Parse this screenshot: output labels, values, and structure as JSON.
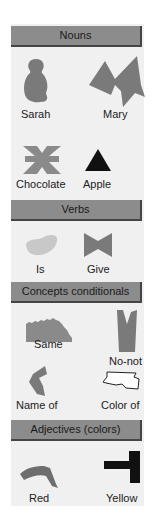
{
  "sections": [
    {
      "title": "Nouns",
      "items": [
        {
          "label": "Sarah",
          "icon": "sarah-symbol-icon"
        },
        {
          "label": "Mary",
          "icon": "mary-symbol-icon"
        },
        {
          "label": "Chocolate",
          "icon": "chocolate-symbol-icon"
        },
        {
          "label": "Apple",
          "icon": "apple-symbol-icon"
        }
      ]
    },
    {
      "title": "Verbs",
      "items": [
        {
          "label": "Is",
          "icon": "is-symbol-icon"
        },
        {
          "label": "Give",
          "icon": "give-symbol-icon"
        }
      ]
    },
    {
      "title": "Concepts conditionals",
      "items": [
        {
          "label": "Same",
          "icon": "same-symbol-icon"
        },
        {
          "label": "No-not",
          "icon": "no-not-symbol-icon"
        },
        {
          "label": "Name of",
          "icon": "name-of-symbol-icon"
        },
        {
          "label": "Color of",
          "icon": "color-of-symbol-icon"
        }
      ]
    },
    {
      "title": "Adjectives (colors)",
      "items": [
        {
          "label": "Red",
          "icon": "red-symbol-icon"
        },
        {
          "label": "Yellow",
          "icon": "yellow-symbol-icon"
        }
      ]
    }
  ],
  "colors": {
    "panel": "#f0f0f0",
    "header": "#8c8c8c",
    "symbol_gray": "#7a7a7a",
    "symbol_black": "#111111",
    "symbol_light": "#c8c8c8"
  }
}
